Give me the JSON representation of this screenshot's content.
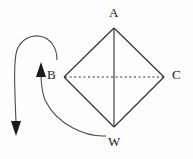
{
  "figure": {
    "width": 193,
    "height": 159,
    "background_color": "#fefefe",
    "stroke_color": "#2b2b2b",
    "label_color": "#1a1a1a"
  },
  "vertices": [
    {
      "id": "A",
      "label": "A",
      "x": 114,
      "y": 28,
      "label_x": 109,
      "label_y": 6
    },
    {
      "id": "B",
      "label": "B",
      "x": 64,
      "y": 77,
      "label_x": 47,
      "label_y": 68
    },
    {
      "id": "C",
      "label": "C",
      "x": 164,
      "y": 77,
      "label_x": 172,
      "label_y": 68
    },
    {
      "id": "W",
      "label": "W",
      "x": 114,
      "y": 127,
      "label_x": 108,
      "label_y": 135
    }
  ],
  "edges": [
    {
      "name": "edge-AB",
      "from": "A",
      "to": "B",
      "style": "solid"
    },
    {
      "name": "edge-AC",
      "from": "A",
      "to": "C",
      "style": "solid"
    },
    {
      "name": "edge-BW",
      "from": "B",
      "to": "W",
      "style": "solid"
    },
    {
      "name": "edge-WC",
      "from": "W",
      "to": "C",
      "style": "solid"
    },
    {
      "name": "diagonal-AW",
      "from": "A",
      "to": "W",
      "style": "solid"
    },
    {
      "name": "diagonal-BC",
      "from": "B",
      "to": "C",
      "style": "dotted"
    }
  ],
  "annotations": [
    {
      "name": "curved-arrow-outer",
      "description": "large curve from near B looping up and over to the far left, ending with a downward arrowhead",
      "start_x": 57,
      "start_y": 60,
      "end_x": 16,
      "end_y": 130,
      "arrowhead": "down"
    },
    {
      "name": "curved-arrow-inner",
      "description": "curve from W sweeping left and up to an upward arrowhead beside B",
      "start_x": 104,
      "start_y": 136,
      "end_x": 41,
      "end_y": 67,
      "arrowhead": "up"
    }
  ]
}
